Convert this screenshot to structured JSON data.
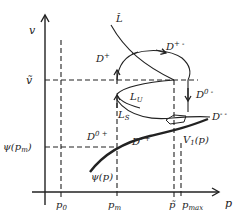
{
  "diagram": {
    "axes": {
      "x_label": "p",
      "y_label": "v"
    },
    "x_ticks": [
      {
        "id": "p0",
        "label": "p",
        "sub": "0"
      },
      {
        "id": "pm",
        "label": "p",
        "sub": "m"
      },
      {
        "id": "ptilde",
        "label": "p̃",
        "sub": ""
      },
      {
        "id": "pmax",
        "label": "p",
        "sub": "max"
      }
    ],
    "y_ticks": [
      {
        "id": "vtilde",
        "label": "ṽ"
      },
      {
        "id": "psi_pm",
        "label": "ψ(p",
        "sub": "m",
        "close": ")"
      }
    ],
    "curves": {
      "psi": {
        "label": "ψ(p)"
      },
      "V1": {
        "label": "V",
        "sub": "1",
        "tail": "(p)"
      },
      "L_hat": {
        "label": "L̂"
      },
      "L_U": {
        "label": "L",
        "sub": "U"
      },
      "L_S": {
        "label": "L",
        "sub": "S"
      }
    },
    "regions": {
      "D_plus": {
        "label": "D",
        "sup": "+"
      },
      "D_plus_minus": {
        "label": "D",
        "sup": "+ -"
      },
      "D_zero_minus": {
        "label": "D",
        "sup": "0 -"
      },
      "D_minus_minus": {
        "label": "D",
        "sup": "- -"
      },
      "D_zero_plus": {
        "label": "D",
        "sup": "0 +"
      },
      "D_minus_plus": {
        "label": "D",
        "sup": "- +"
      }
    },
    "colors": {
      "line": "#222222",
      "background": "#ffffff"
    }
  }
}
